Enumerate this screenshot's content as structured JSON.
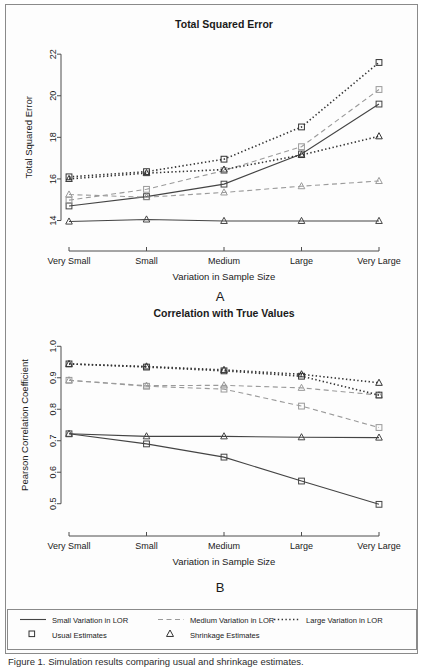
{
  "figure": {
    "caption": "Figure 1. Simulation results comparing usual and shrinkage estimates.",
    "panel_a_letter": "A",
    "panel_b_letter": "B"
  },
  "legend": {
    "line_styles": [
      {
        "key": "small",
        "label": "Small Variation in LOR",
        "dash": "none"
      },
      {
        "key": "medium",
        "label": "Medium Variation in LOR",
        "dash": "dashed"
      },
      {
        "key": "large",
        "label": "Large Variation in LOR",
        "dash": "dotted"
      }
    ],
    "markers": [
      {
        "key": "usual",
        "label": "Usual Estimates",
        "shape": "square"
      },
      {
        "key": "shrinkage",
        "label": "Shrinkage Estimates",
        "shape": "triangle"
      }
    ]
  },
  "colors": {
    "small": "#444444",
    "medium": "#9a9a9a",
    "large": "#333333",
    "axis": "#4d4d4d",
    "frame": "#8a8a8a",
    "text": "#1a1a1a"
  },
  "chart_data": [
    {
      "id": "panel-a",
      "type": "line",
      "title": "Total Squared Error",
      "xlabel": "Variation in Sample Size",
      "ylabel": "Total Squared Error",
      "categories": [
        "Very Small",
        "Small",
        "Medium",
        "Large",
        "Very Large"
      ],
      "yticks": [
        14,
        16,
        18,
        20,
        22
      ],
      "ylim": [
        13.4,
        22.2
      ],
      "grid": false,
      "legend_position": "bottom",
      "series": [
        {
          "name": "Small Variation in LOR — Usual Estimates",
          "style": "solid",
          "marker": "square",
          "color_key": "small",
          "values": [
            14.7,
            15.15,
            15.75,
            17.2,
            19.6
          ]
        },
        {
          "name": "Small Variation in LOR — Shrinkage Estimates",
          "style": "solid",
          "marker": "triangle",
          "color_key": "small",
          "values": [
            13.95,
            14.05,
            13.98,
            13.98,
            13.98
          ]
        },
        {
          "name": "Medium Variation in LOR — Usual Estimates",
          "style": "dashed",
          "marker": "square",
          "color_key": "medium",
          "values": [
            14.98,
            15.5,
            16.4,
            17.55,
            20.3
          ]
        },
        {
          "name": "Medium Variation in LOR — Shrinkage Estimates",
          "style": "dashed",
          "marker": "triangle",
          "color_key": "medium",
          "values": [
            15.25,
            15.12,
            15.35,
            15.65,
            15.9
          ]
        },
        {
          "name": "Large Variation in LOR — Usual Estimates",
          "style": "dotted",
          "marker": "square",
          "color_key": "large",
          "values": [
            16.1,
            16.35,
            16.95,
            18.5,
            21.6
          ]
        },
        {
          "name": "Large Variation in LOR — Shrinkage Estimates",
          "style": "dotted",
          "marker": "triangle",
          "color_key": "large",
          "values": [
            16.0,
            16.28,
            16.45,
            17.15,
            18.05
          ]
        }
      ]
    },
    {
      "id": "panel-b",
      "type": "line",
      "title": "Correlation with True Values",
      "xlabel": "Variation in Sample Size",
      "ylabel": "Pearson Correlation Coefficient",
      "categories": [
        "Very Small",
        "Small",
        "Medium",
        "Large",
        "Very Large"
      ],
      "yticks": [
        0.5,
        0.6,
        0.7,
        0.8,
        0.9,
        1.0
      ],
      "ylim": [
        0.48,
        1.02
      ],
      "grid": false,
      "legend_position": "bottom",
      "series": [
        {
          "name": "Small Variation in LOR — Usual Estimates",
          "style": "solid",
          "marker": "square",
          "color_key": "small",
          "values": [
            0.722,
            0.69,
            0.648,
            0.572,
            0.498
          ]
        },
        {
          "name": "Small Variation in LOR — Shrinkage Estimates",
          "style": "solid",
          "marker": "triangle",
          "color_key": "small",
          "values": [
            0.722,
            0.714,
            0.714,
            0.711,
            0.71
          ]
        },
        {
          "name": "Medium Variation in LOR — Usual Estimates",
          "style": "dashed",
          "marker": "square",
          "color_key": "medium",
          "values": [
            0.892,
            0.873,
            0.864,
            0.81,
            0.742
          ]
        },
        {
          "name": "Medium Variation in LOR — Shrinkage Estimates",
          "style": "dashed",
          "marker": "triangle",
          "color_key": "medium",
          "values": [
            0.892,
            0.875,
            0.876,
            0.868,
            0.845
          ]
        },
        {
          "name": "Large Variation in LOR — Usual Estimates",
          "style": "dotted",
          "marker": "square",
          "color_key": "large",
          "values": [
            0.944,
            0.934,
            0.922,
            0.905,
            0.845
          ]
        },
        {
          "name": "Large Variation in LOR — Shrinkage Estimates",
          "style": "dotted",
          "marker": "triangle",
          "color_key": "large",
          "values": [
            0.944,
            0.936,
            0.925,
            0.911,
            0.884
          ]
        }
      ]
    }
  ]
}
